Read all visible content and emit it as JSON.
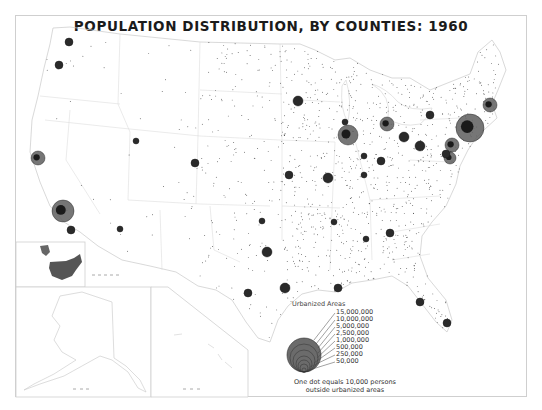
{
  "title": "POPULATION DISTRIBUTION, BY COUNTIES: 1960",
  "colors": {
    "background": "#ffffff",
    "frame": "#cfcfcf",
    "boundary": "#d4d4d4",
    "dot": "#1a1a1a",
    "urban_fill": "#2a2a2a",
    "urban_large_fill": "#5e5e5e",
    "inset_us_fill": "#555555",
    "legend_circle_fill": "#6b6b6b"
  },
  "legend": {
    "title": "Urbanized Areas",
    "values": [
      "15,000,000",
      "10,000,000",
      "5,000,000",
      "2,500,000",
      "1,000,000",
      "500,000",
      "250,000",
      "50,000"
    ],
    "note_line1": "One dot equals 10,000 persons",
    "note_line2": "outside urbanized areas"
  },
  "insets": [
    {
      "name": "US-locator-inset",
      "label": "Locator map"
    },
    {
      "name": "alaska-inset",
      "label": "Alaska"
    },
    {
      "name": "hawaii-inset",
      "label": "Hawaii"
    }
  ],
  "urban_areas": [
    {
      "name": "New York",
      "x": 470,
      "y": 128,
      "r": 14,
      "large": true
    },
    {
      "name": "Los Angeles",
      "x": 63,
      "y": 211,
      "r": 11,
      "large": true
    },
    {
      "name": "Chicago",
      "x": 348,
      "y": 135,
      "r": 10,
      "large": true
    },
    {
      "name": "Detroit",
      "x": 387,
      "y": 124,
      "r": 7,
      "large": true
    },
    {
      "name": "San Francisco",
      "x": 38,
      "y": 158,
      "r": 7,
      "large": true
    },
    {
      "name": "Philadelphia",
      "x": 452,
      "y": 145,
      "r": 7,
      "large": true
    },
    {
      "name": "Boston",
      "x": 490,
      "y": 105,
      "r": 7,
      "large": true
    },
    {
      "name": "Washington",
      "x": 450,
      "y": 158,
      "r": 6,
      "large": true
    },
    {
      "name": "Baltimore",
      "x": 446,
      "y": 154,
      "r": 4,
      "large": false
    },
    {
      "name": "Cleveland",
      "x": 404,
      "y": 137,
      "r": 5,
      "large": false
    },
    {
      "name": "Pittsburgh",
      "x": 420,
      "y": 146,
      "r": 5,
      "large": false
    },
    {
      "name": "Buffalo",
      "x": 430,
      "y": 115,
      "r": 4,
      "large": false
    },
    {
      "name": "Minneapolis",
      "x": 298,
      "y": 101,
      "r": 5,
      "large": false
    },
    {
      "name": "Milwaukee",
      "x": 345,
      "y": 122,
      "r": 3,
      "large": false
    },
    {
      "name": "St. Louis",
      "x": 328,
      "y": 178,
      "r": 5,
      "large": false
    },
    {
      "name": "Kansas City",
      "x": 289,
      "y": 175,
      "r": 4,
      "large": false
    },
    {
      "name": "Cincinnati",
      "x": 381,
      "y": 161,
      "r": 4,
      "large": false
    },
    {
      "name": "Indianapolis",
      "x": 364,
      "y": 156,
      "r": 3,
      "large": false
    },
    {
      "name": "Louisville",
      "x": 364,
      "y": 175,
      "r": 3,
      "large": false
    },
    {
      "name": "Seattle",
      "x": 69,
      "y": 42,
      "r": 4,
      "large": false
    },
    {
      "name": "Portland",
      "x": 59,
      "y": 65,
      "r": 4,
      "large": false
    },
    {
      "name": "San Diego",
      "x": 71,
      "y": 230,
      "r": 4,
      "large": false
    },
    {
      "name": "Denver",
      "x": 195,
      "y": 163,
      "r": 4,
      "large": false
    },
    {
      "name": "Salt Lake City",
      "x": 136,
      "y": 141,
      "r": 3,
      "large": false
    },
    {
      "name": "Phoenix",
      "x": 120,
      "y": 229,
      "r": 3,
      "large": false
    },
    {
      "name": "Dallas",
      "x": 267,
      "y": 252,
      "r": 5,
      "large": false
    },
    {
      "name": "Houston",
      "x": 285,
      "y": 288,
      "r": 5,
      "large": false
    },
    {
      "name": "San Antonio",
      "x": 248,
      "y": 293,
      "r": 4,
      "large": false
    },
    {
      "name": "New Orleans",
      "x": 338,
      "y": 288,
      "r": 4,
      "large": false
    },
    {
      "name": "Atlanta",
      "x": 390,
      "y": 233,
      "r": 4,
      "large": false
    },
    {
      "name": "Miami",
      "x": 447,
      "y": 323,
      "r": 4,
      "large": false
    },
    {
      "name": "Tampa",
      "x": 420,
      "y": 302,
      "r": 4,
      "large": false
    },
    {
      "name": "Memphis",
      "x": 334,
      "y": 222,
      "r": 3,
      "large": false
    },
    {
      "name": "Birmingham",
      "x": 366,
      "y": 239,
      "r": 3,
      "large": false
    },
    {
      "name": "Oklahoma City",
      "x": 262,
      "y": 221,
      "r": 3,
      "large": false
    },
    {
      "name": "Honolulu",
      "x": 200,
      "y": 342,
      "r": 3,
      "large": false
    }
  ]
}
